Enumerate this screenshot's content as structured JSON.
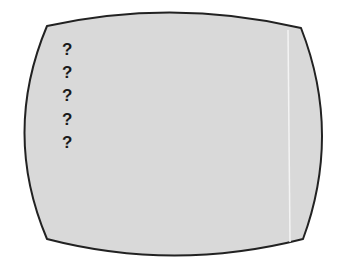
{
  "screen": {
    "fill": "#d9d9d9",
    "outline": "#222222",
    "highlight_line": "#f2f2f2"
  },
  "prompts": [
    "?",
    "?",
    "?",
    "?",
    "?"
  ]
}
